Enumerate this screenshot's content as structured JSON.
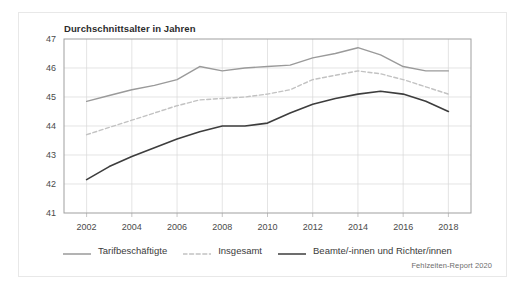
{
  "card": {
    "source_note": "Fehlzeiten-Report 2020"
  },
  "chart_data": {
    "type": "line",
    "title": "Durchschnittsalter in Jahren",
    "xlabel": "",
    "ylabel": "",
    "xlim": [
      2001,
      2019
    ],
    "ylim": [
      41,
      47
    ],
    "yticks": [
      41,
      42,
      43,
      44,
      45,
      46,
      47
    ],
    "ytick_labels": [
      "41",
      "42",
      "43",
      "44",
      "45",
      "46",
      "47"
    ],
    "xticks": [
      2002,
      2004,
      2006,
      2008,
      2010,
      2012,
      2014,
      2016,
      2018
    ],
    "xtick_labels": [
      "2002",
      "2004",
      "2006",
      "2008",
      "2010",
      "2012",
      "2014",
      "2016",
      "2018"
    ],
    "grid": true,
    "grid_color": "#d9d9d9",
    "legend_position": "bottom",
    "x": [
      2002,
      2003,
      2004,
      2005,
      2006,
      2007,
      2008,
      2009,
      2010,
      2011,
      2012,
      2013,
      2014,
      2015,
      2016,
      2017,
      2018
    ],
    "series": [
      {
        "name": "Tarifbeschäftigte",
        "color": "#9a9a9a",
        "style": "solid",
        "width": 1.4,
        "values": [
          44.85,
          45.05,
          45.25,
          45.4,
          45.6,
          46.05,
          45.9,
          46.0,
          46.05,
          46.1,
          46.35,
          46.5,
          46.7,
          46.45,
          46.05,
          45.9,
          45.9
        ]
      },
      {
        "name": "Insgesamt",
        "color": "#c2c2c2",
        "style": "dashed",
        "width": 1.4,
        "values": [
          43.7,
          43.95,
          44.2,
          44.45,
          44.7,
          44.9,
          44.95,
          45.0,
          45.1,
          45.25,
          45.6,
          45.75,
          45.9,
          45.8,
          45.6,
          45.35,
          45.1
        ]
      },
      {
        "name": "Beamte/-innen und Richter/innen",
        "color": "#3d3d3d",
        "style": "solid",
        "width": 1.6,
        "values": [
          42.15,
          42.6,
          42.95,
          43.25,
          43.55,
          43.8,
          44.0,
          44.0,
          44.1,
          44.45,
          44.75,
          44.95,
          45.1,
          45.2,
          45.1,
          44.85,
          44.5
        ]
      }
    ]
  }
}
